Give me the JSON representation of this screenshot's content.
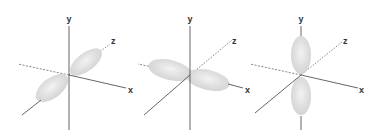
{
  "figure": {
    "panels": [
      {
        "id": "pz",
        "orbital_axis": "z",
        "axis_labels": {
          "x": "x",
          "y": "y",
          "z": "z"
        },
        "origin": [
          69,
          75
        ]
      },
      {
        "id": "px",
        "orbital_axis": "x",
        "axis_labels": {
          "x": "x",
          "y": "y",
          "z": "z"
        },
        "origin": [
          190,
          75
        ]
      },
      {
        "id": "py",
        "orbital_axis": "y",
        "axis_labels": {
          "x": "x",
          "y": "y",
          "z": "z"
        },
        "origin": [
          301,
          75
        ]
      }
    ],
    "colors": {
      "axis": "#555555",
      "lobe": "#d9d9d9",
      "label": "#333333"
    }
  }
}
